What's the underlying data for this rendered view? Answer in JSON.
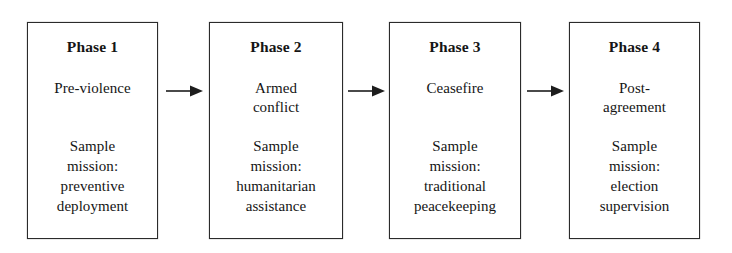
{
  "diagram": {
    "orientation": "left-to-right",
    "line_color": "#2b2b2b",
    "background_color": "#ffffff",
    "text_color": "#151515",
    "phases": [
      {
        "title": "Phase 1",
        "state_lines": [
          "Pre-violence"
        ],
        "mission_lines": [
          "Sample",
          "mission:",
          "preventive",
          "deployment"
        ]
      },
      {
        "title": "Phase 2",
        "state_lines": [
          "Armed",
          "conflict"
        ],
        "mission_lines": [
          "Sample",
          "mission:",
          "humanitarian",
          "assistance"
        ]
      },
      {
        "title": "Phase 3",
        "state_lines": [
          "Ceasefire"
        ],
        "mission_lines": [
          "Sample",
          "mission:",
          "traditional",
          "peacekeeping"
        ]
      },
      {
        "title": "Phase 4",
        "state_lines": [
          "Post-",
          "agreement"
        ],
        "mission_lines": [
          "Sample",
          "mission:",
          "election",
          "supervision"
        ]
      }
    ],
    "connectors": [
      {
        "name": "arrow-phase1-to-phase2",
        "symbol": "right-arrow"
      },
      {
        "name": "arrow-phase2-to-phase3",
        "symbol": "right-arrow"
      },
      {
        "name": "arrow-phase3-to-phase4",
        "symbol": "right-arrow"
      }
    ]
  }
}
